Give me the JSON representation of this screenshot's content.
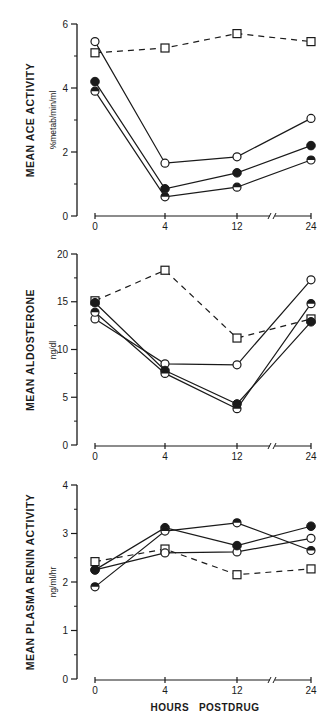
{
  "figure": {
    "xlabel": "HOURS   POSTDRUG",
    "x_tick_labels": [
      "0",
      "4",
      "12",
      "24"
    ]
  },
  "panels": [
    {
      "ylabel": "MEAN ACE ACTIVITY",
      "yunit": "%metab/min/ml",
      "y_tick_labels": [
        "0",
        "2",
        "4",
        "6"
      ]
    },
    {
      "ylabel": "MEAN ALDOSTERONE",
      "yunit": "ng/dl",
      "y_tick_labels": [
        "0",
        "5",
        "10",
        "15",
        "20"
      ]
    },
    {
      "ylabel": "MEAN PLASMA RENIN ACTIVITY",
      "yunit": "ng/ml/hr",
      "y_tick_labels": [
        "0",
        "1",
        "2",
        "3",
        "4"
      ]
    }
  ],
  "chart_data": [
    {
      "type": "line",
      "title": "",
      "xlabel": "HOURS POSTDRUG",
      "ylabel": "MEAN ACE ACTIVITY (%metab/min/ml)",
      "x": [
        0,
        4,
        12,
        24
      ],
      "x_axis_break": "between 12 and 24",
      "ylim": [
        0,
        6
      ],
      "y_ticks": [
        0,
        2,
        4,
        6
      ],
      "grid": false,
      "legend": null,
      "series": [
        {
          "name": "open square (dashed)",
          "marker": "open-square",
          "line": "dashed",
          "values": [
            5.1,
            5.25,
            5.7,
            5.45
          ]
        },
        {
          "name": "open circle",
          "marker": "open-circle",
          "line": "solid",
          "values": [
            5.45,
            1.65,
            1.85,
            3.05
          ]
        },
        {
          "name": "filled circle",
          "marker": "filled-circle",
          "line": "solid",
          "values": [
            4.2,
            0.85,
            1.35,
            2.2
          ]
        },
        {
          "name": "half-filled circle",
          "marker": "half-circle",
          "line": "solid",
          "values": [
            3.9,
            0.6,
            0.9,
            1.75
          ]
        }
      ]
    },
    {
      "type": "line",
      "title": "",
      "xlabel": "HOURS POSTDRUG",
      "ylabel": "MEAN ALDOSTERONE (ng/dl)",
      "x": [
        0,
        4,
        12,
        24
      ],
      "x_axis_break": "between 12 and 24",
      "ylim": [
        0,
        20
      ],
      "y_ticks": [
        0,
        5,
        10,
        15,
        20
      ],
      "grid": false,
      "legend": null,
      "series": [
        {
          "name": "open square (dashed)",
          "marker": "open-square",
          "line": "dashed",
          "values": [
            15.1,
            18.3,
            11.2,
            13.2
          ]
        },
        {
          "name": "open circle",
          "marker": "open-circle",
          "line": "solid",
          "values": [
            13.2,
            8.5,
            8.4,
            17.3
          ]
        },
        {
          "name": "filled circle",
          "marker": "filled-circle",
          "line": "solid",
          "values": [
            14.9,
            7.8,
            4.3,
            12.9
          ]
        },
        {
          "name": "half-filled circle",
          "marker": "half-circle",
          "line": "solid",
          "values": [
            13.9,
            7.5,
            3.8,
            14.8
          ]
        }
      ]
    },
    {
      "type": "line",
      "title": "",
      "xlabel": "HOURS POSTDRUG",
      "ylabel": "MEAN PLASMA RENIN ACTIVITY (ng/ml/hr)",
      "x": [
        0,
        4,
        12,
        24
      ],
      "x_axis_break": "between 12 and 24",
      "ylim": [
        0,
        4
      ],
      "y_ticks": [
        0,
        1,
        2,
        3,
        4
      ],
      "grid": false,
      "legend": null,
      "series": [
        {
          "name": "open square (dashed)",
          "marker": "open-square",
          "line": "dashed",
          "values": [
            2.42,
            2.68,
            2.15,
            2.27
          ]
        },
        {
          "name": "open circle",
          "marker": "open-circle",
          "line": "solid",
          "values": [
            2.25,
            2.6,
            2.62,
            2.9
          ]
        },
        {
          "name": "filled circle",
          "marker": "filled-circle",
          "line": "solid",
          "values": [
            2.25,
            3.12,
            2.75,
            3.15
          ]
        },
        {
          "name": "half-filled circle",
          "marker": "half-circle",
          "line": "solid",
          "values": [
            1.9,
            3.05,
            3.22,
            2.65
          ]
        }
      ]
    }
  ]
}
